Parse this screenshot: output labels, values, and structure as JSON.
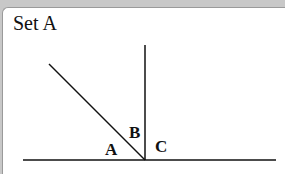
{
  "title": "Set A",
  "labels": {
    "a": "A",
    "b": "B",
    "c": "C"
  },
  "colors": {
    "line": "#111111",
    "background": "#ffffff",
    "frame": "#c8c8c8"
  }
}
